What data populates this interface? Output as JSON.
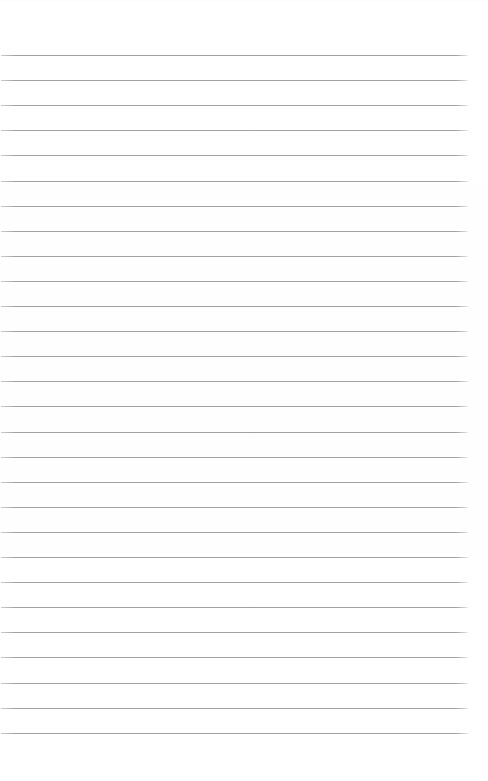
{
  "document": {
    "kind": "lined-paper-scan",
    "title": "Blank lined paper",
    "page_width": 488,
    "page_height": 781,
    "background_color": "#ffffff",
    "has_text_content": false,
    "written_content": ""
  },
  "rules": {
    "label": "horizontal ruling lines",
    "count": 28,
    "color": "#9a9a9e",
    "thickness_px": 1,
    "first_line_y": 55,
    "spacing_px": 25.1,
    "line_start_x": 1,
    "line_end_x": 468,
    "line_length_px": 467
  },
  "margins": {
    "top_margin_px": 55,
    "bottom_margin_px": 48,
    "left_margin_px": 1,
    "right_margin_px": 20
  }
}
